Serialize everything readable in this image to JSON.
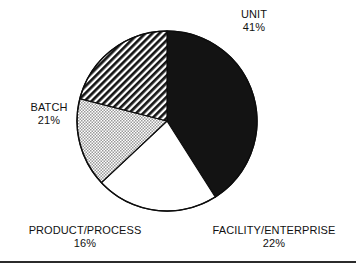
{
  "chart_data": {
    "type": "pie",
    "title": "",
    "subtitle": "",
    "xlabel": "",
    "ylabel": "",
    "legend_position": "none",
    "grid": false,
    "categories": [
      "UNIT",
      "FACILITY/ENTERPRISE",
      "PRODUCT/PROCESS",
      "BATCH"
    ],
    "values": [
      41,
      22,
      16,
      21
    ],
    "value_unit": "%",
    "total": 100,
    "start_angle_deg": 0,
    "direction": "clockwise",
    "slices": [
      {
        "label": "UNIT",
        "value": 41,
        "value_text": "41%",
        "fill": "solid-black",
        "color": "#111111",
        "start_deg": 0,
        "end_deg": 147.6
      },
      {
        "label": "FACILITY/ENTERPRISE",
        "value": 22,
        "value_text": "22%",
        "fill": "white",
        "color": "#ffffff",
        "start_deg": 147.6,
        "end_deg": 226.8
      },
      {
        "label": "PRODUCT/PROCESS",
        "value": 16,
        "value_text": "16%",
        "fill": "dotted-gray",
        "color": "#c9c9c9",
        "start_deg": 226.8,
        "end_deg": 284.4
      },
      {
        "label": "BATCH",
        "value": 21,
        "value_text": "21%",
        "fill": "diagonal-hatch",
        "color": "#1d1d1d",
        "start_deg": 284.4,
        "end_deg": 360
      }
    ]
  },
  "labels": {
    "unit": {
      "name": "UNIT",
      "pct": "41%"
    },
    "batch": {
      "name": "BATCH",
      "pct": "21%"
    },
    "product": {
      "name": "PRODUCT/PROCESS",
      "pct": "16%"
    },
    "facility": {
      "name": "FACILITY/ENTERPRISE",
      "pct": "22%"
    }
  }
}
